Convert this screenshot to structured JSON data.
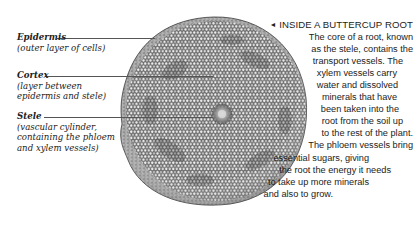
{
  "figure": {
    "colors": {
      "background": "#ffffff",
      "cell_light": "#e4e4e4",
      "cell_mid": "#a8a8a8",
      "cell_dark": "#5a5a5a",
      "outline": "#3a3a3a",
      "leader_line": "#555555"
    }
  },
  "labels": [
    {
      "title": "Epidermis",
      "description_lines": [
        "(outer layer of cells)"
      ]
    },
    {
      "title": "Cortex",
      "description_lines": [
        "(layer between",
        "epidermis and stele)"
      ]
    },
    {
      "title": "Stele",
      "description_lines": [
        "(vascular cylinder,",
        "containing the phloem",
        "and xylem vessels)"
      ]
    }
  ],
  "caption": {
    "arrow_icon": "◄",
    "heading": "INSIDE A BUTTERCUP ROOT",
    "lines": [
      "The core of a root, known",
      "as the stele, contains the",
      "transport vessels. The",
      "xylem vessels carry",
      "water and dissolved",
      "minerals that have",
      "been taken into the",
      "root from the soil up",
      "to the rest of the plant.",
      "The phloem vessels bring",
      "essential sugars, giving",
      "the root the energy it needs",
      "to take up more minerals",
      "and also to grow."
    ]
  }
}
